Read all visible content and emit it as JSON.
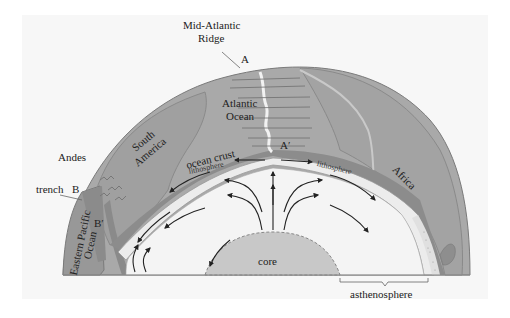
{
  "figure": {
    "type": "cross-section diagram",
    "colors": {
      "background_panel": "#f7f7f7",
      "continent_surface": "#a8a8a8",
      "continent_edge": "#8c8c8c",
      "continent_dark": "#8f8f8f",
      "ocean_crust": "#9a9a9a",
      "lithosphere": "#ececec",
      "asthenosphere": "#f4f4f4",
      "core": "#c8c8c8",
      "ridge": "#f0f0f0",
      "arrows": "#222222"
    }
  },
  "labels": {
    "ridge_name": "Mid-Atlantic",
    "ridge_name_2": "Ridge",
    "point_a": "A",
    "point_a_prime": "A′",
    "atlantic": "Atlantic",
    "atlantic_2": "Ocean",
    "south_america": "South",
    "south_america_2": "America",
    "africa": "Africa",
    "ocean_crust": "ocean crust",
    "lithosphere_left": "lithosphere",
    "lithosphere_right": "lithosphere",
    "andes": "Andes",
    "trench": "trench",
    "point_b": "B",
    "point_b_prime": "B′",
    "pacific": "Eastern Pacific",
    "pacific_2": "Ocean",
    "core": "core",
    "asthenosphere": "asthenosphere"
  }
}
